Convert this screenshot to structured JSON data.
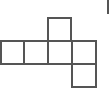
{
  "diagram": {
    "type": "cube-net",
    "stroke_color": "#555555",
    "square_size": 24,
    "faces": [
      {
        "id": "top",
        "x": 47,
        "y": 17
      },
      {
        "id": "row-1",
        "x": 0,
        "y": 40
      },
      {
        "id": "row-2",
        "x": 23,
        "y": 40
      },
      {
        "id": "row-3",
        "x": 47,
        "y": 40
      },
      {
        "id": "row-4",
        "x": 71,
        "y": 40
      },
      {
        "id": "bottom",
        "x": 71,
        "y": 63
      }
    ]
  }
}
